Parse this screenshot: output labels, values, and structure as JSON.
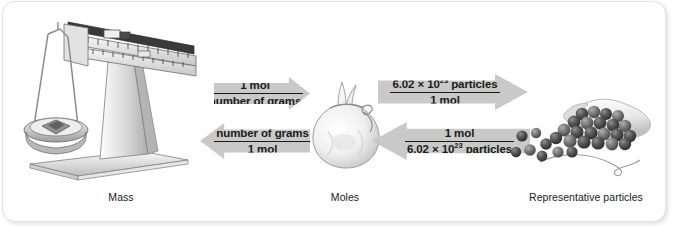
{
  "figure": {
    "colors": {
      "arrow_fill": "#c9c9c9",
      "text": "#1a1a1a",
      "card_background": "#ffffff",
      "card_border": "#e3e3e3"
    }
  },
  "stages": {
    "mass": {
      "caption": "Mass",
      "illustration": "triple-beam-balance"
    },
    "moles": {
      "caption": "Moles",
      "illustration": "tied-sack"
    },
    "particles": {
      "caption": "Representative particles",
      "illustration": "spheres-spilling-from-bag"
    }
  },
  "arrows": {
    "mass_to_moles": {
      "direction": "right",
      "numerator": "1 mol",
      "denominator": "number of grams"
    },
    "moles_to_mass": {
      "direction": "left",
      "numerator": "number of grams",
      "denominator": "1 mol"
    },
    "moles_to_particles": {
      "direction": "right",
      "numerator_prefix": "6.02 ",
      "numerator_times": "×",
      "numerator_base": " 10",
      "numerator_exponent": "23",
      "numerator_suffix": " particles",
      "denominator": "1 mol"
    },
    "particles_to_moles": {
      "direction": "left",
      "numerator": "1 mol",
      "denominator_prefix": "6.02 ",
      "denominator_times": "×",
      "denominator_base": " 10",
      "denominator_exponent": "23",
      "denominator_suffix": " particles"
    }
  }
}
